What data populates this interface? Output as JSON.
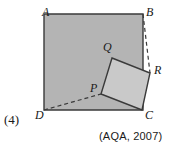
{
  "figure": {
    "caption_marks": "(4)",
    "source": "(AQA, 2007)",
    "colors": {
      "outer_square_fill": "#b4b4b4",
      "inner_square_fill": "#c9c9c9",
      "stroke": "#3a3a3a",
      "background": "#ffffff"
    },
    "labels": {
      "A": "A",
      "B": "B",
      "C": "C",
      "D": "D",
      "P": "P",
      "Q": "Q",
      "R": "R"
    },
    "geometry": {
      "outer_square": {
        "name": "ABCD",
        "points": "44,14 143,14 143,110 44,110",
        "vertices": {
          "A": [
            44,
            14
          ],
          "B": [
            143,
            14
          ],
          "C": [
            143,
            110
          ],
          "D": [
            44,
            110
          ]
        }
      },
      "inner_square": {
        "name": "PQRC",
        "points": "112,58 150,73 142,110 101,94",
        "vertices": {
          "Q": [
            112,
            58
          ],
          "R": [
            150,
            73
          ],
          "C": [
            142,
            110
          ],
          "P": [
            101,
            94
          ]
        }
      },
      "dashed_lines": [
        {
          "name": "B-to-R",
          "x1": 143,
          "y1": 14,
          "x2": 150,
          "y2": 73
        },
        {
          "name": "D-to-P",
          "x1": 44,
          "y1": 110,
          "x2": 101,
          "y2": 94
        }
      ]
    }
  }
}
